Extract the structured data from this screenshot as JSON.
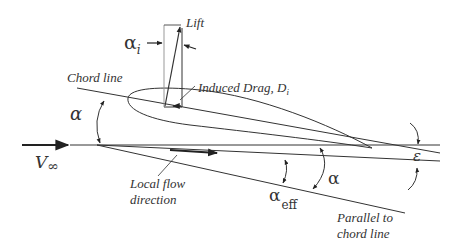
{
  "diagram": {
    "labels": {
      "alpha_i_symbol": "α",
      "alpha_i_subscript": "i",
      "lift": "Lift",
      "induced_drag": "Induced Drag, D",
      "induced_drag_subscript": "i",
      "chord_line": "Chord line",
      "alpha_left": "α",
      "v_inf_symbol": "V",
      "v_inf_subscript": "∞",
      "local_flow_line1": "Local flow",
      "local_flow_line2": "direction",
      "alpha_eff_symbol": "α",
      "alpha_eff_subscript": "eff",
      "alpha_right": "α",
      "epsilon": "ε",
      "parallel_line1": "Parallel to",
      "parallel_line2": "chord line"
    },
    "colors": {
      "stroke": "#333333",
      "background": "#ffffff"
    }
  }
}
